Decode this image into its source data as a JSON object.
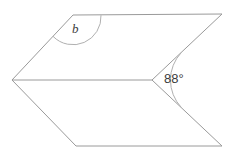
{
  "figure": {
    "name": "parallelogram-with-triangle-angle-diagram",
    "background_color": "#ffffff",
    "stroke_color": "#9a9a9a",
    "arc_color": "#b0b0b0",
    "text_color": "#3c3c3c",
    "stroke_width": 1,
    "width": 231,
    "height": 158
  },
  "labels": {
    "unknown_angle": "b",
    "known_angle": "88°"
  },
  "vertices": {
    "top_left": {
      "x": 73,
      "y": 15
    },
    "top_right": {
      "x": 222,
      "y": 14
    },
    "left": {
      "x": 12,
      "y": 80
    },
    "middle_right": {
      "x": 152,
      "y": 80
    },
    "bottom_left": {
      "x": 76,
      "y": 146
    },
    "bottom_right": {
      "x": 222,
      "y": 146
    }
  },
  "edges": [
    {
      "name": "top-edge",
      "from": "top_left",
      "to": "top_right"
    },
    {
      "name": "upper-left-edge",
      "from": "left",
      "to": "top_left"
    },
    {
      "name": "upper-right-edge",
      "from": "middle_right",
      "to": "top_right"
    },
    {
      "name": "middle-edge",
      "from": "left",
      "to": "middle_right"
    },
    {
      "name": "lower-left-edge",
      "from": "left",
      "to": "bottom_left"
    },
    {
      "name": "bottom-edge",
      "from": "bottom_left",
      "to": "bottom_right"
    },
    {
      "name": "lower-right-edge",
      "from": "middle_right",
      "to": "bottom_right"
    }
  ],
  "arcs": [
    {
      "name": "angle-arc-b",
      "vertex": "top_left",
      "radius": 28
    },
    {
      "name": "angle-arc-88",
      "vertex": "middle_right",
      "radius": 40
    }
  ]
}
